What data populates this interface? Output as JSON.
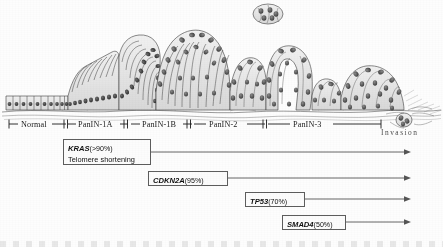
{
  "figure": {
    "type": "diagram"
  },
  "stages": [
    {
      "id": "normal",
      "label": "Normal",
      "left_px": 14,
      "width_px": 54
    },
    {
      "id": "panin1a",
      "label": "PanIN-1A",
      "left_px": 66,
      "width_px": 62
    },
    {
      "id": "panin1b",
      "label": "PanIN-1B",
      "left_px": 127,
      "width_px": 62
    },
    {
      "id": "panin2",
      "label": "PanIN-2",
      "left_px": 189,
      "width_px": 76
    },
    {
      "id": "panin3",
      "label": "PanIN-3",
      "left_px": 266,
      "width_px": 116
    }
  ],
  "invasion": {
    "label": "Invasion"
  },
  "genes": [
    {
      "id": "kras",
      "name": "KRAS",
      "percent": "(>90%)",
      "subtitle": "Telomere shortening",
      "box": {
        "left": 63,
        "top": 139,
        "width": 88,
        "height": 26
      },
      "arrow": {
        "x1": 151,
        "x2": 411,
        "y": 152
      }
    },
    {
      "id": "cdkn2a",
      "name": "CDKN2A",
      "percent": "(95%)",
      "subtitle": "",
      "box": {
        "left": 148,
        "top": 171,
        "width": 80,
        "height": 15
      },
      "arrow": {
        "x1": 228,
        "x2": 411,
        "y": 178
      }
    },
    {
      "id": "tp53",
      "name": "TP53",
      "percent": "(70%)",
      "subtitle": "",
      "box": {
        "left": 245,
        "top": 192,
        "width": 60,
        "height": 15
      },
      "arrow": {
        "x1": 305,
        "x2": 411,
        "y": 199
      }
    },
    {
      "id": "smad4",
      "name": "SMAD4",
      "percent": "(50%)",
      "subtitle": "",
      "box": {
        "left": 282,
        "top": 215,
        "width": 64,
        "height": 15
      },
      "arrow": {
        "x1": 346,
        "x2": 411,
        "y": 222
      }
    }
  ],
  "colors": {
    "ink": "#1b1b1b",
    "box_border": "#5d5d5d",
    "arrow": "#555555",
    "paper": "#fdfdfc"
  }
}
